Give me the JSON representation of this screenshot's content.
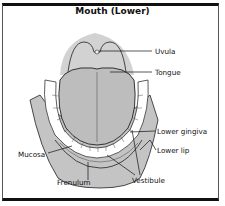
{
  "title": "Mouth (Lower)",
  "labels": {
    "uvula": "Uvula",
    "tongue": "Tongue",
    "lower_gingiva": "Lower gingiva",
    "lower_lip": "Lower lip",
    "mucosa": "Mucosa",
    "frenulum": "Frenulum",
    "vestibule": "Vestibule"
  },
  "colors": {
    "tissue": "#c8c8c8",
    "palate": "#d6d6d6",
    "tongue": "#bfbfbf",
    "teeth": "#ffffff",
    "outline": "#222222",
    "frame": "#111111"
  }
}
